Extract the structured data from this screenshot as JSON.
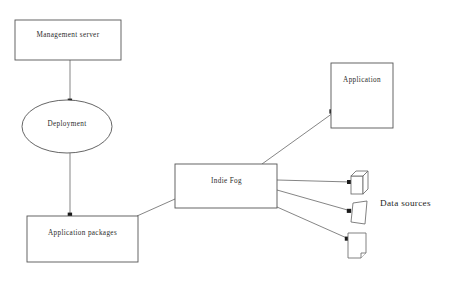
{
  "diagram": {
    "background_color": "#ffffff",
    "stroke_color": "#6f6f6f",
    "text_color": "#2b2b2b",
    "nodes": [
      {
        "id": "management-server",
        "label": "Management server",
        "shape": "rectangle",
        "x": 15,
        "y": 20,
        "w": 106,
        "h": 40
      },
      {
        "id": "deployment",
        "label": "Deployment",
        "shape": "ellipse",
        "x": 22,
        "y": 100,
        "w": 90,
        "h": 53
      },
      {
        "id": "application-packages",
        "label": "Application packages",
        "shape": "rectangle",
        "x": 27,
        "y": 216,
        "w": 111,
        "h": 46
      },
      {
        "id": "indie-fog",
        "label": "Indie Fog",
        "shape": "rectangle",
        "x": 175,
        "y": 164,
        "w": 102,
        "h": 44
      },
      {
        "id": "application",
        "label": "Application",
        "shape": "rectangle",
        "x": 331,
        "y": 63,
        "w": 62,
        "h": 65
      }
    ],
    "data_sources": {
      "label": "Data sources",
      "items": [
        {
          "id": "data-source-1",
          "shape": "cube",
          "x": 351,
          "y": 171,
          "w": 17,
          "h": 23
        },
        {
          "id": "data-source-2",
          "shape": "sheet",
          "x": 351,
          "y": 201,
          "w": 16,
          "h": 23
        },
        {
          "id": "data-source-3",
          "shape": "page",
          "x": 348,
          "y": 233,
          "w": 18,
          "h": 25
        }
      ]
    },
    "connectors": [
      {
        "id": "mgmt-to-deployment",
        "from": "management-server",
        "to": "deployment",
        "arrow": true,
        "style": "vertical"
      },
      {
        "id": "deployment-to-packages",
        "from": "deployment",
        "to": "application-packages",
        "arrow": true,
        "style": "vertical"
      },
      {
        "id": "packages-to-fog",
        "from": "application-packages",
        "to": "indie-fog",
        "arrow": false,
        "style": "diagonal"
      },
      {
        "id": "fog-to-application",
        "from": "indie-fog",
        "to": "application",
        "arrow": true,
        "style": "diagonal"
      },
      {
        "id": "fog-to-source-1",
        "from": "indie-fog",
        "to": "data-source-1",
        "arrow": true,
        "style": "horizontal"
      },
      {
        "id": "fog-to-source-2",
        "from": "indie-fog",
        "to": "data-source-2",
        "arrow": true,
        "style": "diagonal"
      },
      {
        "id": "fog-to-source-3",
        "from": "indie-fog",
        "to": "data-source-3",
        "arrow": true,
        "style": "diagonal"
      }
    ]
  }
}
